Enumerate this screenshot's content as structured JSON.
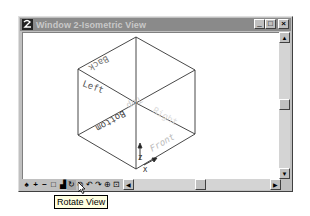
{
  "window": {
    "title": "Window 2-Isometric View",
    "app_icon": "app-logo-icon",
    "controls": {
      "minimize": "_",
      "maximize": "□",
      "close": "×"
    }
  },
  "view": {
    "type": "isometric-cube",
    "face_labels": {
      "back": "Back",
      "left": "Left",
      "top": "Top",
      "right": "Right",
      "bottom": "Bottom",
      "front": "Front"
    },
    "axes": {
      "z": "Z",
      "x": "X"
    }
  },
  "toolbar": {
    "tools": [
      {
        "name": "pan-icon",
        "glyph": "♠"
      },
      {
        "name": "zoom-in-icon",
        "glyph": "+"
      },
      {
        "name": "zoom-out-icon",
        "glyph": "−"
      },
      {
        "name": "window-area-icon",
        "glyph": "□"
      },
      {
        "name": "fit-view-icon",
        "glyph": "▟"
      },
      {
        "name": "rotate-view-icon",
        "glyph": "↻"
      },
      {
        "name": "link-icon",
        "glyph": "⊘"
      },
      {
        "name": "undo-view-icon",
        "glyph": "↶"
      },
      {
        "name": "redo-view-icon",
        "glyph": "↷"
      },
      {
        "name": "view-options-icon",
        "glyph": "⊕"
      },
      {
        "name": "view-settings-icon",
        "glyph": "⊡"
      }
    ],
    "active_tool": "rotate-view-icon"
  },
  "scrollbars": {
    "vertical": {
      "up": "▲",
      "down": "▼"
    },
    "horizontal": {
      "left": "◀",
      "right": "▶"
    }
  },
  "tooltip": {
    "text": "Rotate View"
  }
}
